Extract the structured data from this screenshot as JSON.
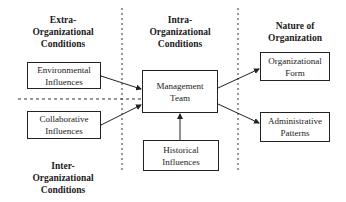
{
  "headings": {
    "extra": [
      "Extra-",
      "Organizational",
      "Conditions"
    ],
    "intra": [
      "Intra-",
      "Organizational",
      "Conditions"
    ],
    "nature": [
      "Nature of",
      "Organization"
    ],
    "inter": [
      "Inter-",
      "Organizational",
      "Conditions"
    ]
  },
  "boxes": {
    "environmental": [
      "Environmental",
      "Influences"
    ],
    "collaborative": [
      "Collaborative",
      "Influences"
    ],
    "management": [
      "Management",
      "Team"
    ],
    "historical": [
      "Historical",
      "Influences"
    ],
    "org_form": [
      "Organizational",
      "Form"
    ],
    "admin": [
      "Administrative",
      "Patterns"
    ]
  },
  "colors": {
    "line": "#222222",
    "background": "#ffffff"
  }
}
